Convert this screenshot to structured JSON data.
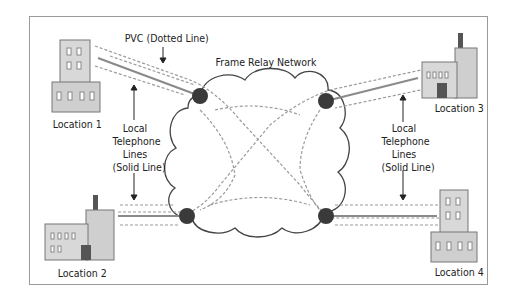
{
  "diagram": {
    "network_label": "Frame Relay Network",
    "pvc_label": "PVC (Dotted Line)",
    "local_lines_left": [
      "Local",
      "Telephone",
      "Lines",
      "(Solid Line)"
    ],
    "local_lines_right": [
      "Local",
      "Telephone",
      "Lines",
      "(Solid Line)"
    ],
    "locations": [
      {
        "label": "Location 1",
        "type": "tall-building"
      },
      {
        "label": "Location 2",
        "type": "factory"
      },
      {
        "label": "Location 3",
        "type": "factory"
      },
      {
        "label": "Location 4",
        "type": "tall-building"
      }
    ],
    "colors": {
      "border": "#9a9a9a",
      "cloud_stroke": "#444444",
      "node": "#3a3a3a",
      "solid_line": "#8a8a8a",
      "dotted_line": "#9a9a9a",
      "building": "#d8d8d8"
    }
  }
}
